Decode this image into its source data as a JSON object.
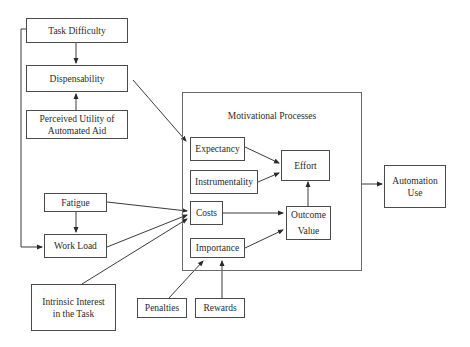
{
  "diagram": {
    "nodes": {
      "task_difficulty": "Task Difficulty",
      "dispensability": "Dispensability",
      "perceived_utility": "Perceived Utility of\nAutomated Aid",
      "fatigue": "Fatigue",
      "work_load": "Work Load",
      "intrinsic_interest": "Intrinsic Interest\nin the Task",
      "penalties": "Penalties",
      "rewards": "Rewards",
      "motivational_processes": "Motivational Processes",
      "expectancy": "Expectancy",
      "instrumentality": "Instrumentality",
      "costs": "Costs",
      "importance": "Importance",
      "effort": "Effort",
      "outcome_value": "Outcome\n\nValue",
      "automation_use": "Automation\nUse"
    },
    "edges": [
      {
        "from": "Task Difficulty",
        "to": "Dispensability"
      },
      {
        "from": "Task Difficulty",
        "to": "Work Load"
      },
      {
        "from": "Perceived Utility of Automated Aid",
        "to": "Dispensability"
      },
      {
        "from": "Dispensability",
        "to": "Expectancy"
      },
      {
        "from": "Fatigue",
        "to": "Work Load"
      },
      {
        "from": "Fatigue",
        "to": "Costs"
      },
      {
        "from": "Work Load",
        "to": "Costs"
      },
      {
        "from": "Intrinsic Interest in the Task",
        "to": "Costs"
      },
      {
        "from": "Penalties",
        "to": "Importance"
      },
      {
        "from": "Rewards",
        "to": "Importance"
      },
      {
        "from": "Expectancy",
        "to": "Effort"
      },
      {
        "from": "Instrumentality",
        "to": "Effort"
      },
      {
        "from": "Costs",
        "to": "Outcome Value"
      },
      {
        "from": "Importance",
        "to": "Outcome Value"
      },
      {
        "from": "Outcome Value",
        "to": "Effort"
      },
      {
        "from": "Motivational Processes",
        "to": "Automation Use"
      }
    ]
  }
}
